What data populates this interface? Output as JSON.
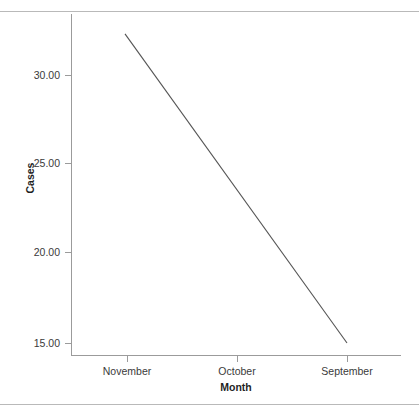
{
  "chart_data": {
    "type": "line",
    "title": "",
    "xlabel": "Month",
    "ylabel": "Cases",
    "categories": [
      "November",
      "October",
      "September"
    ],
    "series": [
      {
        "name": "Cases",
        "values": [
          30.25,
          22.6,
          15.0
        ]
      }
    ],
    "line_endpoints": {
      "start": {
        "x_value": "left-edge",
        "y_value": 32.3
      },
      "end": {
        "x_value": "September",
        "y_value": 15.0
      }
    },
    "yticks": [
      "15.00",
      "20.00",
      "25.00",
      "30.00"
    ],
    "ytick_values": [
      15,
      20,
      25,
      30
    ],
    "ylim": [
      13.3,
      34.2
    ],
    "grid": false,
    "legend": false,
    "legend_position": "none",
    "line_color": "#545454",
    "axis_color": "#9b9b9b",
    "text_color": "#3a3a3a",
    "background": "#ffffff"
  },
  "axes": {
    "y_title": "Cases",
    "x_title": "Month",
    "y_ticks": [
      {
        "label": "30.00",
        "value": 30
      },
      {
        "label": "25.00",
        "value": 25
      },
      {
        "label": "20.00",
        "value": 20
      },
      {
        "label": "15.00",
        "value": 15
      }
    ],
    "x_ticks": [
      {
        "label": "November"
      },
      {
        "label": "October"
      },
      {
        "label": "September"
      }
    ]
  }
}
